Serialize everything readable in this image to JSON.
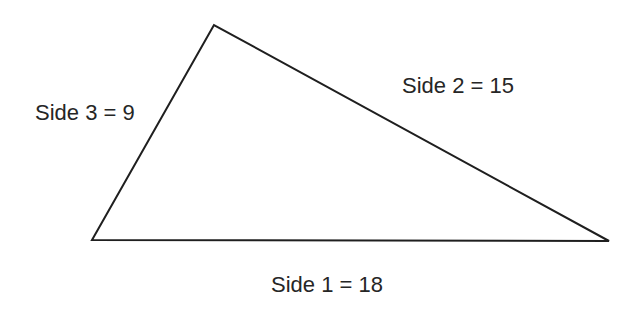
{
  "diagram": {
    "type": "triangle",
    "stroke_color": "#1f1f1f",
    "text_color": "#262626",
    "vertices": {
      "top": [
        214,
        25
      ],
      "bottom_left": [
        92,
        240
      ],
      "bottom_right": [
        609,
        241
      ]
    },
    "sides": [
      {
        "name": "Side 1",
        "length": 18,
        "label": "Side 1 = 18"
      },
      {
        "name": "Side 2",
        "length": 15,
        "label": "Side 2 = 15"
      },
      {
        "name": "Side 3",
        "length": 9,
        "label": "Side 3 = 9"
      }
    ]
  }
}
